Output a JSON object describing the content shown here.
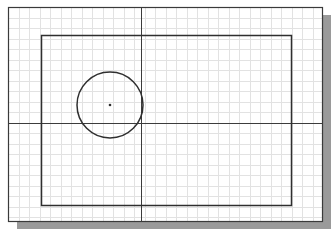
{
  "canvas": {
    "width": 333,
    "height": 232,
    "background": "#ffffff"
  },
  "sheet": {
    "x": 8,
    "y": 7,
    "width": 314,
    "height": 214,
    "stroke": "#3a3a3a",
    "fill": "#ffffff",
    "shadow": {
      "offset_x": 9,
      "offset_y": 8,
      "color": "#9a9a9a"
    }
  },
  "grid": {
    "spacing": 10.5,
    "color": "#e2e2e2"
  },
  "axes": {
    "vertical_x": 141,
    "horizontal_y": 123,
    "stroke": "#3c3c3c"
  },
  "rectangle": {
    "x": 41,
    "y": 35,
    "width": 250,
    "height": 170,
    "stroke": "#2f2f2f"
  },
  "circle": {
    "cx": 110,
    "cy": 105,
    "r": 33,
    "stroke": "#2f2f2f",
    "center_mark": true
  }
}
